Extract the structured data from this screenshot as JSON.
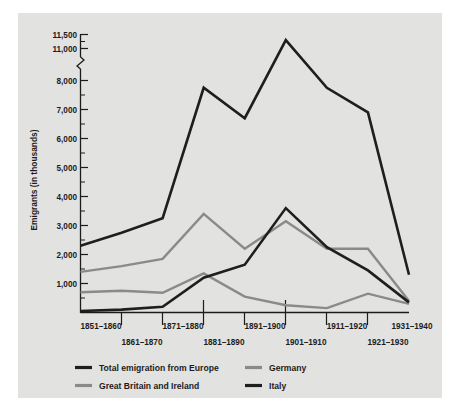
{
  "chart_data": {
    "type": "line",
    "title": "",
    "subtitle": "",
    "xlabel": "",
    "ylabel": "Emigrants (in thousands)",
    "categories": [
      "1851–1860",
      "1861–1870",
      "1871–1880",
      "1881–1890",
      "1891–1900",
      "1901–1910",
      "1911–1920",
      "1921–1930",
      "1931–1940"
    ],
    "ytick_labels": [
      "1,000",
      "2,000",
      "3,000",
      "4,000",
      "5,000",
      "6,000",
      "7,000",
      "8,000",
      "11,000",
      "11,500"
    ],
    "ytick_values": [
      1000,
      2000,
      3000,
      4000,
      5000,
      6000,
      7000,
      8000,
      11000,
      11500
    ],
    "yminor_step": 500,
    "ylim": [
      0,
      11500
    ],
    "axis_break": {
      "present": true,
      "between": [
        8000,
        11000
      ],
      "note": "y-axis broken between 8,000 and 11,000"
    },
    "grid": false,
    "legend_position": "below-axes",
    "series": [
      {
        "name": "Total emigration from Europe",
        "color": "#1e1e1e",
        "width": 2.6,
        "values": [
          2300,
          2750,
          3250,
          7750,
          6700,
          11300,
          7750,
          6900,
          1300
        ]
      },
      {
        "name": "Great Britain and Ireland",
        "color": "#8a8a8a",
        "width": 2.4,
        "values": [
          1400,
          1600,
          1850,
          3400,
          2200,
          3150,
          2200,
          2200,
          400
        ]
      },
      {
        "name": "Germany",
        "color": "#8a8a8a",
        "width": 2.4,
        "values": [
          700,
          750,
          680,
          1350,
          550,
          250,
          150,
          650,
          300
        ]
      },
      {
        "name": "Italy",
        "color": "#1e1e1e",
        "width": 2.6,
        "values": [
          50,
          100,
          200,
          1200,
          1650,
          3600,
          2250,
          1450,
          350
        ]
      }
    ]
  },
  "axes": {
    "y_title": "Emigrants (in thousands)",
    "yticks": [
      {
        "label": "11,500",
        "value": 11500
      },
      {
        "label": "11,000",
        "value": 11000
      },
      {
        "label": "8,000",
        "value": 8000
      },
      {
        "label": "7,000",
        "value": 7000
      },
      {
        "label": "6,000",
        "value": 6000
      },
      {
        "label": "5,000",
        "value": 5000
      },
      {
        "label": "4,000",
        "value": 4000
      },
      {
        "label": "3,000",
        "value": 3000
      },
      {
        "label": "2,000",
        "value": 2000
      },
      {
        "label": "1,000",
        "value": 1000
      }
    ],
    "xticks_top_row": [
      "1851–1860",
      "1871–1880",
      "1891–1900",
      "1911–1920",
      "1931–1940"
    ],
    "xticks_bottom_row": [
      "1861–1870",
      "1881–1890",
      "1901–1910",
      "1921–1930"
    ]
  },
  "legend": {
    "entries": [
      {
        "label": "Total emigration from Europe",
        "color": "#1e1e1e",
        "swatch": "line-swatch-dark"
      },
      {
        "label": "Germany",
        "color": "#8a8a8a",
        "swatch": "line-swatch-gray"
      },
      {
        "label": "Great Britain and Ireland",
        "color": "#8a8a8a",
        "swatch": "line-swatch-gray"
      },
      {
        "label": "Italy",
        "color": "#1e1e1e",
        "swatch": "line-swatch-dark"
      }
    ]
  },
  "colors": {
    "page_background": "#ffffff",
    "plate_background": "#e2e2e0",
    "dark_series": "#1e1e1e",
    "gray_series": "#8a8a8a",
    "axis": "#1c1c1c",
    "text": "#1c1c1c"
  }
}
